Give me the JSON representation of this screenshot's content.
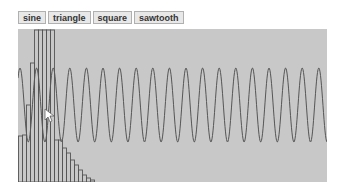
{
  "toolbar": {
    "buttons": [
      {
        "label": "sine"
      },
      {
        "label": "triangle"
      },
      {
        "label": "square"
      },
      {
        "label": "sawtooth"
      }
    ]
  },
  "canvas": {
    "background": "#c8c8c8",
    "stroke": "#555555",
    "waveform": {
      "type": "sine",
      "period_px": 16.6,
      "center_y": 76,
      "amplitude_px": 37
    },
    "histogram_bar_tops": [
      107,
      106,
      76,
      34,
      1,
      1,
      1,
      1,
      1,
      111,
      111,
      119,
      124,
      131,
      136,
      141,
      146,
      149,
      151
    ]
  },
  "cursor": {
    "x": 44,
    "y": 110
  }
}
